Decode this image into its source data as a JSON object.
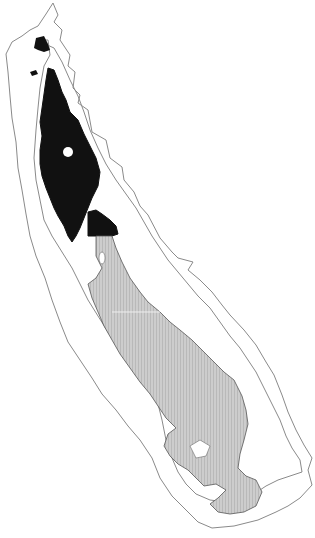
{
  "map": {
    "width": 315,
    "height": 538,
    "background": "#ffffff",
    "regions": [
      {
        "name": "outer-boundary",
        "fill": "#ffffff",
        "stroke": "#8a8a8a"
      },
      {
        "name": "northern-region-black",
        "fill": "#111111",
        "stroke": "#111111"
      },
      {
        "name": "southern-region-gray-hatched",
        "fill": "#c9c9c9",
        "stroke": "#555555"
      },
      {
        "name": "inner-boundary",
        "fill": "none",
        "stroke": "#8a8a8a"
      }
    ],
    "labels": []
  }
}
